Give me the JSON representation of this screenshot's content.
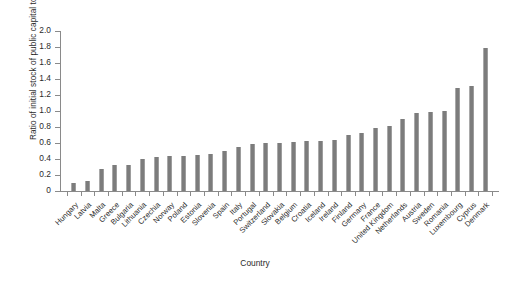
{
  "chart_data": {
    "type": "bar",
    "title": "",
    "xlabel": "Country",
    "ylabel": "Ratio of initial stock of public capital to GDP",
    "ylim": [
      0,
      2.0
    ],
    "ytick_labels": [
      "0",
      "0.2",
      "0.4",
      "0.6",
      "0.8",
      "1.0",
      "1.2",
      "1.4",
      "1.6",
      "1.8",
      "2.0"
    ],
    "ytick_values": [
      0,
      0.2,
      0.4,
      0.6,
      0.8,
      1.0,
      1.2,
      1.4,
      1.6,
      1.8,
      2.0
    ],
    "grid": false,
    "legend": "none",
    "bar_color": "#7c7c7c",
    "categories": [
      "Hungary",
      "Latvia",
      "Malta",
      "Greece",
      "Bulgaria",
      "Lithuania",
      "Czechia",
      "Norway",
      "Poland",
      "Estonia",
      "Slovenia",
      "Spain",
      "Italy",
      "Portugal",
      "Switzerland",
      "Slovakia",
      "Belgium",
      "Croatia",
      "Iceland",
      "Ireland",
      "Finland",
      "Germany",
      "France",
      "United Kingdom",
      "Netherlands",
      "Austria",
      "Sweden",
      "Romania",
      "Luxembourg",
      "Cyprus",
      "Denmark"
    ],
    "values": [
      0.1,
      0.13,
      0.28,
      0.33,
      0.33,
      0.4,
      0.43,
      0.44,
      0.44,
      0.45,
      0.46,
      0.5,
      0.55,
      0.59,
      0.6,
      0.6,
      0.61,
      0.62,
      0.63,
      0.64,
      0.7,
      0.73,
      0.79,
      0.81,
      0.9,
      0.97,
      0.99,
      1.0,
      1.29,
      1.31,
      1.79
    ]
  }
}
